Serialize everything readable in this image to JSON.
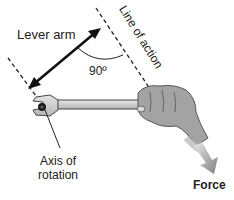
{
  "diagram": {
    "labels": {
      "lever_arm": "Lever arm",
      "line_of_action": "Line of action",
      "angle": "90º",
      "axis_line1": "Axis of",
      "axis_line2": "rotation",
      "force": "Force"
    },
    "elements": [
      {
        "id": "lever-arm-arrow",
        "type": "double-arrow",
        "from": [
          29,
          88
        ],
        "to": [
          101,
          28
        ]
      },
      {
        "id": "line-of-action",
        "type": "dashed-line",
        "from": [
          96,
          8
        ],
        "to": [
          150,
          90
        ]
      },
      {
        "id": "axis-reference-line",
        "type": "dashed-line",
        "from": [
          8,
          58
        ],
        "to": [
          40,
          100
        ]
      },
      {
        "id": "right-angle-arc",
        "type": "arc",
        "angle_deg": 90
      },
      {
        "id": "wrench",
        "type": "shape"
      },
      {
        "id": "hand",
        "type": "shape"
      },
      {
        "id": "force-arrow",
        "type": "arrow",
        "direction": "down-right"
      }
    ],
    "colors": {
      "ink": "#111111",
      "wrench_fill": "#cfcfcf",
      "hand_fill": "#9a9a9a",
      "force_arrow": "#8a8a8a"
    }
  }
}
